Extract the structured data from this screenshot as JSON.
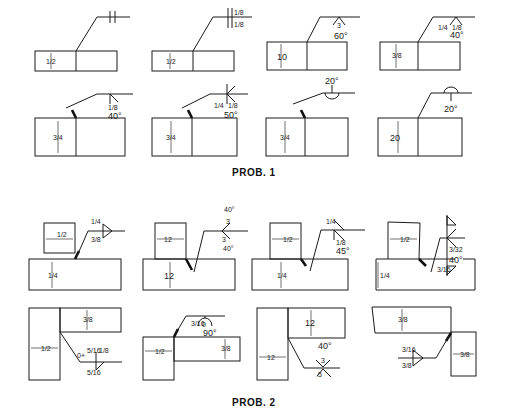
{
  "prob1": {
    "title": "PROB. 1",
    "figures": [
      {
        "id": "1a",
        "thickness": "1/2",
        "symbol": "square-groove-both",
        "values": []
      },
      {
        "id": "1b",
        "thickness": "1/2",
        "symbol": "square-groove-both",
        "values": [
          "1/8",
          "1/8"
        ]
      },
      {
        "id": "1c",
        "thickness": "10",
        "symbol": "v-groove",
        "values": [
          "3",
          "60°"
        ]
      },
      {
        "id": "1d",
        "thickness": "3/8",
        "symbol": "v-groove",
        "values": [
          "1/4",
          "1/8",
          "40°"
        ]
      },
      {
        "id": "1e",
        "thickness": "3/4",
        "symbol": "bevel",
        "values": [
          "1/8",
          "40°"
        ]
      },
      {
        "id": "1f",
        "thickness": "3/4",
        "symbol": "double-bevel",
        "values": [
          "1/4",
          "1/8",
          "50°"
        ]
      },
      {
        "id": "1g",
        "thickness": "3/4",
        "symbol": "u-groove",
        "values": [
          "20°"
        ]
      },
      {
        "id": "1h",
        "thickness": "20",
        "symbol": "u-groove-other-side",
        "values": [
          "20°"
        ]
      }
    ]
  },
  "prob2": {
    "title": "PROB. 2",
    "figures": [
      {
        "id": "2a",
        "dims": [
          "1/2",
          "1/4"
        ],
        "values": [
          "1/4",
          "3/8"
        ]
      },
      {
        "id": "2b",
        "dims": [
          "12",
          "12"
        ],
        "values": [
          "40°",
          "3",
          "3",
          "40°"
        ]
      },
      {
        "id": "2c",
        "dims": [
          "1/2",
          "1/4"
        ],
        "values": [
          "1/4",
          "1/8",
          "45°"
        ]
      },
      {
        "id": "2d",
        "dims": [
          "1/2",
          "1/4"
        ],
        "values": [
          "3/32",
          "40°",
          "3/16"
        ]
      },
      {
        "id": "2e",
        "dims": [
          "1/2",
          "3/8"
        ],
        "values": [
          "0+",
          "5/16",
          "1/8",
          "5/16"
        ]
      },
      {
        "id": "2f",
        "dims": [
          "1/2",
          "3/8"
        ],
        "values": [
          "3/16",
          "0",
          "90°"
        ]
      },
      {
        "id": "2g",
        "dims": [
          "12",
          "12"
        ],
        "values": [
          "40°",
          "3",
          ".5"
        ]
      },
      {
        "id": "2h",
        "dims": [
          "3/8",
          "3/8"
        ],
        "values": [
          "3/16",
          "3/8"
        ]
      }
    ]
  },
  "labels": {
    "half": "1/2",
    "quarter": "1/4",
    "eighth": "1/8",
    "3-8": "3/8",
    "3-4": "3/4",
    "3-16": "3/16",
    "5-16": "5/16",
    "3-32": "3/32",
    "ten": "10",
    "twenty": "20",
    "twelve": "12",
    "three": "3",
    "zero": "0",
    "zero_plus": "0+",
    "point_five": ".5",
    "deg60": "60°",
    "deg40": "40°",
    "deg50": "50°",
    "deg20": "20°",
    "deg45": "45°",
    "deg90": "90°"
  }
}
